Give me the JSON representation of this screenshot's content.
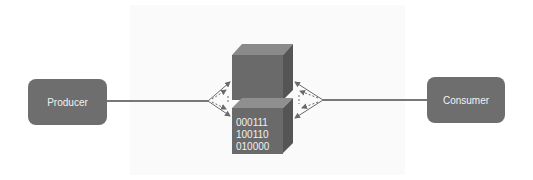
{
  "diagram": {
    "nodes": {
      "producer": {
        "label": "Producer"
      },
      "consumer": {
        "label": "Consumer"
      },
      "storage_top": {
        "label": ""
      },
      "storage_bottom": {
        "label_lines": [
          "000111",
          "100110",
          "010000"
        ]
      }
    },
    "edges": [
      {
        "from": "producer",
        "to": "storage",
        "style": "solid line splitting into solid and dashed arrows"
      },
      {
        "from": "consumer",
        "to": "storage",
        "style": "solid line splitting into solid and dashed arrows"
      }
    ],
    "colors": {
      "node_fill": "#6e6e6e",
      "cube_front": "#6a6a6a",
      "cube_top": "#8a8a8a",
      "cube_side": "#555555",
      "line": "#777777",
      "text": "#f2f2f2"
    }
  }
}
